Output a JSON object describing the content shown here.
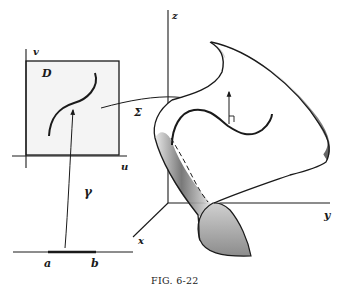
{
  "figure": {
    "caption": "Fig. 6-22",
    "caption_display": "FIG. 6-22"
  },
  "parameter_domain": {
    "region_label": "D",
    "axis_u_label": "u",
    "axis_v_label": "v"
  },
  "interval": {
    "left_label": "a",
    "right_label": "b"
  },
  "mapping": {
    "curve_map_label": "γ",
    "surface_map_label": "Σ"
  },
  "space_axes": {
    "x_label": "x",
    "y_label": "y",
    "z_label": "z"
  },
  "colors": {
    "ink": "#1a1a1a",
    "shade_dark": "#555555",
    "shade_light": "#cfcfcf",
    "domain_fill": "#f2f2f2"
  }
}
